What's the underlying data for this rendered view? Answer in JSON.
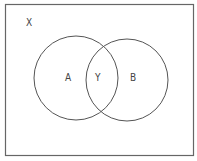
{
  "diagram": {
    "type": "venn",
    "universe_label": "X",
    "sets": [
      {
        "label": "A"
      },
      {
        "label": "B"
      }
    ],
    "intersection_label": "Y",
    "colors": {
      "stroke": "#555555",
      "background": "#ffffff",
      "frame": "#666666"
    }
  }
}
